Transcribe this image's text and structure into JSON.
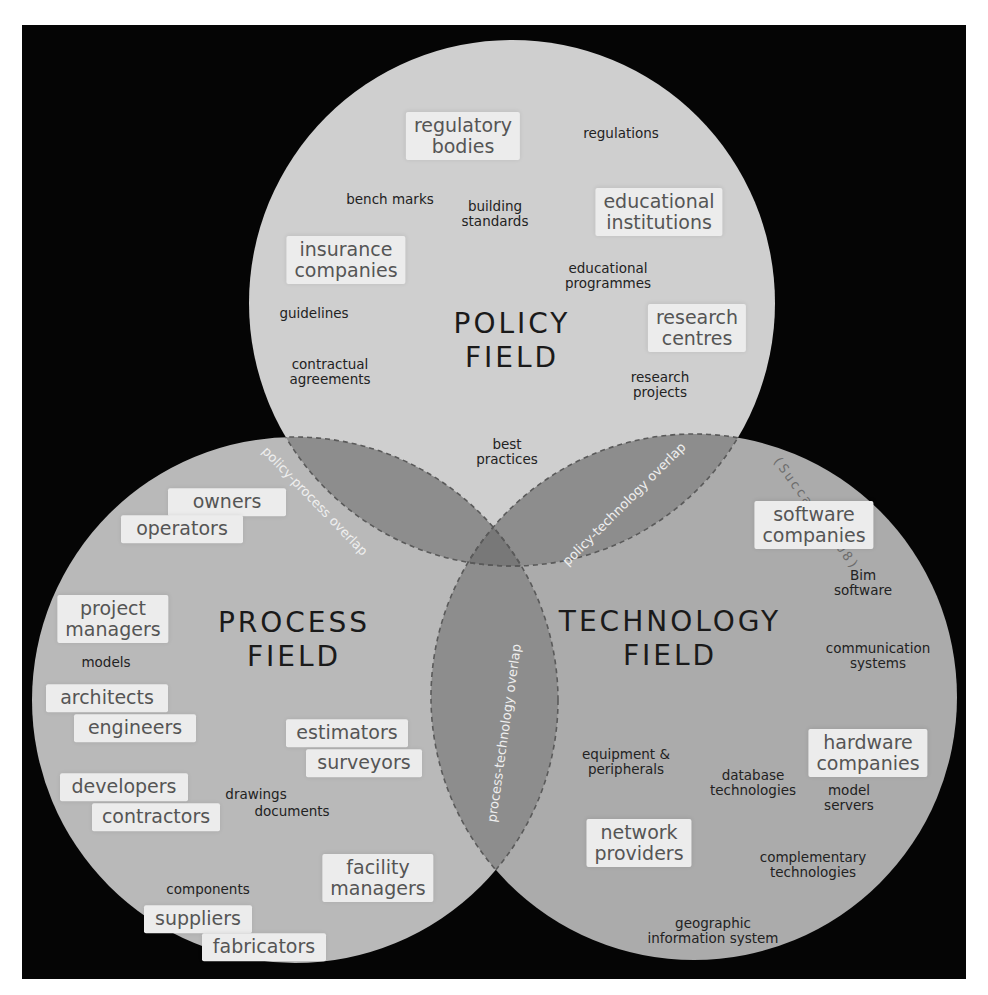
{
  "colors": {
    "background": "#050505",
    "policy_circle": "#cfcfcf",
    "process_circle": "#b9b9b9",
    "technology_circle": "#ababab",
    "overlap": "#8d8d8d",
    "center_overlap": "#787878",
    "box_fill": "#ececec",
    "box_text": "#555555",
    "small_text": "#222222",
    "overlap_text": "#eeeeee",
    "dashed_outline": "#5a5a5a"
  },
  "citation": "(Succar, 2008)",
  "policy": {
    "title_line1": "POLICY",
    "title_line2": "FIELD",
    "boxes": [
      {
        "l1": "regulatory",
        "l2": "bodies"
      },
      {
        "l1": "educational",
        "l2": "institutions"
      },
      {
        "l1": "insurance",
        "l2": "companies"
      },
      {
        "l1": "research",
        "l2": "centres"
      }
    ],
    "terms": [
      {
        "l1": "regulations"
      },
      {
        "l1": "bench marks"
      },
      {
        "l1": "building",
        "l2": "standards"
      },
      {
        "l1": "educational",
        "l2": "programmes"
      },
      {
        "l1": "guidelines"
      },
      {
        "l1": "contractual",
        "l2": "agreements"
      },
      {
        "l1": "research",
        "l2": "projects"
      },
      {
        "l1": "best",
        "l2": "practices"
      }
    ]
  },
  "process": {
    "title_line1": "PROCESS",
    "title_line2": "FIELD",
    "boxes": [
      {
        "l1": "owners"
      },
      {
        "l1": "operators"
      },
      {
        "l1": "project",
        "l2": "managers"
      },
      {
        "l1": "architects"
      },
      {
        "l1": "engineers"
      },
      {
        "l1": "estimators"
      },
      {
        "l1": "surveyors"
      },
      {
        "l1": "developers"
      },
      {
        "l1": "contractors"
      },
      {
        "l1": "facility",
        "l2": "managers"
      },
      {
        "l1": "suppliers"
      },
      {
        "l1": "fabricators"
      }
    ],
    "terms": [
      {
        "l1": "models"
      },
      {
        "l1": "drawings"
      },
      {
        "l1": "documents"
      },
      {
        "l1": "components"
      }
    ]
  },
  "technology": {
    "title_line1": "TECHNOLOGY",
    "title_line2": "FIELD",
    "boxes": [
      {
        "l1": "software",
        "l2": "companies"
      },
      {
        "l1": "hardware",
        "l2": "companies"
      },
      {
        "l1": "network",
        "l2": "providers"
      }
    ],
    "terms": [
      {
        "l1": "Bim",
        "l2": "software"
      },
      {
        "l1": "communication",
        "l2": "systems"
      },
      {
        "l1": "equipment &",
        "l2": "peripherals"
      },
      {
        "l1": "database",
        "l2": "technologies"
      },
      {
        "l1": "model",
        "l2": "servers"
      },
      {
        "l1": "complementary",
        "l2": "technologies"
      },
      {
        "l1": "geographic",
        "l2": "information system"
      }
    ]
  },
  "overlaps": {
    "policy_process": "policy-process overlap",
    "policy_technology": "policy-technology overlap",
    "process_technology": "process-technology overlap"
  }
}
